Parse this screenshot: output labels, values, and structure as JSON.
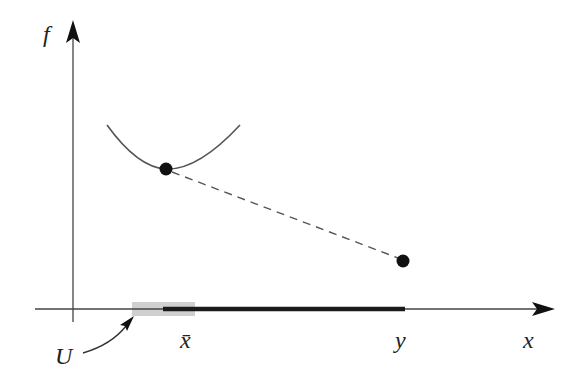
{
  "diagram": {
    "type": "function-plot-sketch",
    "axes": {
      "vertical_label": "f",
      "horizontal_label": "x"
    },
    "labels": {
      "f": "f",
      "x": "x",
      "x_bar": "x̄",
      "y": "y",
      "U": "U"
    },
    "elements": {
      "curve": "local convex curve with minimum at x̄",
      "point_xbar": "filled dot at (x̄, f(x̄))",
      "point_y": "filled dot at (y, f(y))",
      "dashed_segment": "dashed line from (x̄, f(x̄)) to (y, f(y))",
      "neighborhood_U": "grey shaded interval around x̄ on x-axis",
      "segment_xbar_y": "thick black segment on x-axis from x̄ to y",
      "U_pointer": "curved arrow from label U to shaded neighborhood"
    },
    "colors": {
      "axis": "#333333",
      "curve": "#555555",
      "points": "#111111",
      "dashed": "#555555",
      "neighborhood": "#cfcfcf",
      "thick_segment": "#1a1a1a"
    }
  }
}
